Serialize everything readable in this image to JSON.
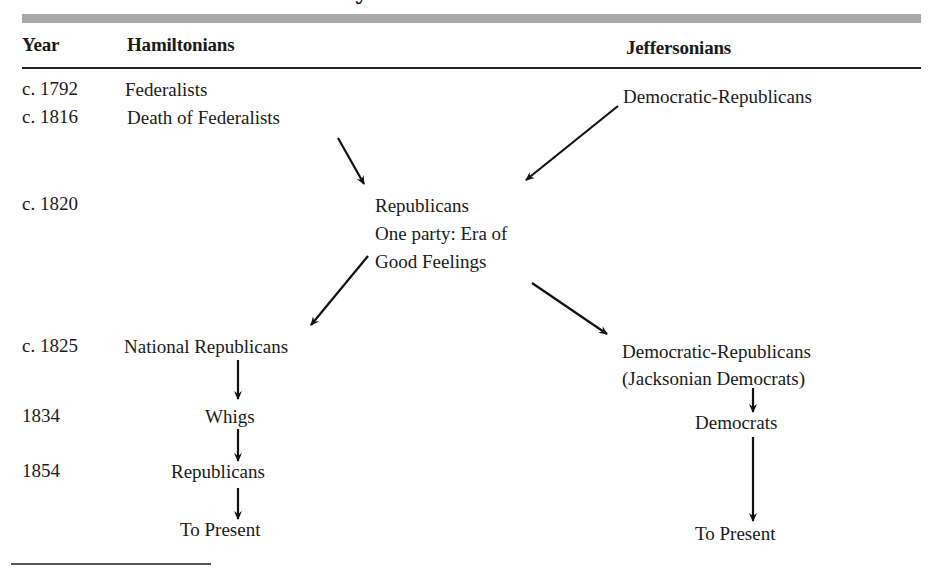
{
  "title_fragment": "y",
  "header": {
    "year": "Year",
    "hamiltonians": "Hamiltonians",
    "jeffersonians": "Jeffersonians"
  },
  "years": [
    "c. 1792",
    "c. 1816",
    "c. 1820",
    "c. 1825",
    "1834",
    "1854"
  ],
  "hamiltonian_nodes": {
    "federalists": "Federalists",
    "death_of_federalists": "Death of Federalists",
    "national_republicans": "National Republicans",
    "whigs": "Whigs",
    "republicans": "Republicans",
    "to_present": "To Present"
  },
  "center_node": {
    "line1": "Republicans",
    "line2": "One party: Era of",
    "line3": "Good Feelings"
  },
  "jeffersonian_nodes": {
    "democratic_republicans": "Democratic-Republicans",
    "democratic_republicans_2": "Democratic-Republicans",
    "jacksonian_democrats": "(Jacksonian Democrats)",
    "democrats": "Democrats",
    "to_present": "To Present"
  },
  "colors": {
    "bar": "#a9a9a9",
    "text": "#1a1a1a",
    "arrow": "#111111"
  }
}
